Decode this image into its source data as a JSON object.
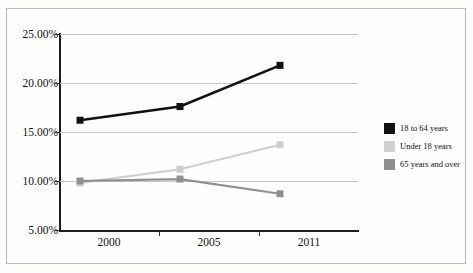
{
  "chart_data": {
    "type": "line",
    "title": "",
    "subtitle": "",
    "xlabel": "",
    "ylabel": "",
    "categories": [
      "2000",
      "2005",
      "2011"
    ],
    "ylim": [
      5,
      25
    ],
    "yticks": [
      5,
      10,
      15,
      20,
      25
    ],
    "ytick_labels": [
      "5.00%",
      "10.00%",
      "15.00%",
      "20.00%",
      "25.00%"
    ],
    "grid": true,
    "legend_position": "right",
    "value_suffix": "%",
    "series": [
      {
        "name": "18 to 64 years",
        "color": "#111111",
        "values": [
          16.2,
          17.6,
          21.8
        ],
        "line_width": 2.6,
        "marker": "square"
      },
      {
        "name": "Under 18 years",
        "color": "#cfcfcf",
        "values": [
          9.8,
          11.2,
          13.7
        ],
        "line_width": 2.2,
        "marker": "square"
      },
      {
        "name": "65 years and over",
        "color": "#8f8f8f",
        "values": [
          10.0,
          10.2,
          8.7
        ],
        "line_width": 2.2,
        "marker": "square"
      }
    ]
  },
  "legend": {
    "items": [
      {
        "label": "18 to 64 years",
        "color": "#111111"
      },
      {
        "label": "Under 18 years",
        "color": "#cfcfcf"
      },
      {
        "label": "65 years and over",
        "color": "#8f8f8f"
      }
    ]
  },
  "axes": {
    "y_labels": [
      "25.00%",
      "20.00%",
      "15.00%",
      "10.00%",
      "5.00%"
    ],
    "x_labels": [
      "2000",
      "2005",
      "2011"
    ]
  }
}
